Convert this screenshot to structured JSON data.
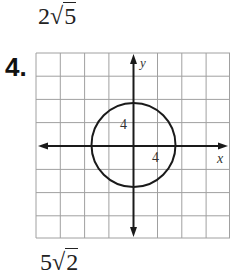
{
  "top_answer": {
    "coef": "2",
    "radical": "√",
    "radicand": "5"
  },
  "problem": {
    "number_label": "4."
  },
  "bottom_answer": {
    "coef": "5",
    "radical": "√",
    "radicand": "2"
  },
  "graph": {
    "x_axis_label": "x",
    "y_axis_label": "y",
    "y_tick_label": "4",
    "x_tick_label": "4",
    "grid_color": "#9a9a9a",
    "axis_color": "#1a1a1a",
    "circle": {
      "center": [
        0,
        0
      ],
      "radius": 4
    }
  }
}
